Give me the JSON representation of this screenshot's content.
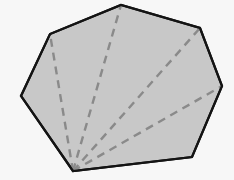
{
  "figure": {
    "background_color": "#f7f7f7",
    "canvas": {
      "width": 234,
      "height": 180
    },
    "polygon": {
      "name": "heptagon",
      "sides": 7,
      "fill_color": "#c8c8c8",
      "stroke_color": "#141414",
      "stroke_width": 2.2,
      "vertices": [
        {
          "label": "A",
          "x": 73,
          "y": 171
        },
        {
          "label": "B",
          "x": 21,
          "y": 96
        },
        {
          "label": "C",
          "x": 50,
          "y": 34
        },
        {
          "label": "D",
          "x": 121,
          "y": 5
        },
        {
          "label": "E",
          "x": 200,
          "y": 28
        },
        {
          "label": "F",
          "x": 222,
          "y": 86
        },
        {
          "label": "G",
          "x": 192,
          "y": 157
        }
      ],
      "points_attr": "73,171 21,96 50,34 121,5 200,28 222,86 192,157"
    },
    "diagonals": {
      "count": 4,
      "stroke_color": "#8a8a8a",
      "stroke_width": 2.4,
      "dash_pattern": "8 6",
      "apex": {
        "label": "A",
        "x": 73,
        "y": 171
      },
      "lines": [
        {
          "name": "diagonal-a-c",
          "from": "A",
          "to": "C",
          "x1": 73,
          "y1": 171,
          "x2": 50,
          "y2": 34
        },
        {
          "name": "diagonal-a-d",
          "from": "A",
          "to": "D",
          "x1": 73,
          "y1": 171,
          "x2": 121,
          "y2": 5
        },
        {
          "name": "diagonal-a-e",
          "from": "A",
          "to": "E",
          "x1": 73,
          "y1": 171,
          "x2": 200,
          "y2": 28
        },
        {
          "name": "diagonal-a-f",
          "from": "A",
          "to": "F",
          "x1": 73,
          "y1": 171,
          "x2": 222,
          "y2": 86
        }
      ]
    },
    "triangles": 5
  }
}
